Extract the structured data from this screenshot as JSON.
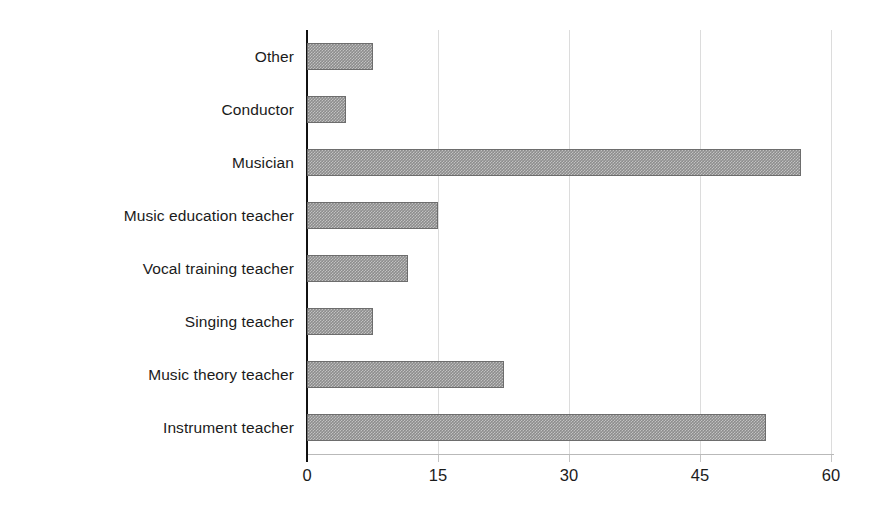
{
  "chart_data": {
    "type": "bar",
    "orientation": "horizontal",
    "title": "",
    "subtitle": "",
    "xlabel": "",
    "ylabel": "",
    "categories": [
      "Instrument teacher",
      "Music theory teacher",
      "Singing teacher",
      "Vocal training teacher",
      "Music education teacher",
      "Musician",
      "Conductor",
      "Other"
    ],
    "values": [
      52.5,
      22.5,
      7.5,
      11.5,
      15,
      56.5,
      4.5,
      7.5
    ],
    "xlim": [
      0,
      60
    ],
    "xticks": [
      0,
      15,
      30,
      45,
      60
    ],
    "xtick_labels": [
      "0",
      "15",
      "30",
      "45",
      "60"
    ],
    "grid": "vertical",
    "legend": "none",
    "bar_fill_color": "#8d8d8d",
    "bar_edge_color": "#6d6d6d",
    "axis_color": "#111111",
    "gridline_color": "#dcdcdc",
    "bars": [
      {
        "category": "Other",
        "value": 7.5,
        "row": 0
      },
      {
        "category": "Conductor",
        "value": 4.5,
        "row": 1
      },
      {
        "category": "Musician",
        "value": 56.5,
        "row": 2
      },
      {
        "category": "Music education teacher",
        "value": 15,
        "row": 3
      },
      {
        "category": "Vocal training teacher",
        "value": 11.5,
        "row": 4
      },
      {
        "category": "Singing teacher",
        "value": 7.5,
        "row": 5
      },
      {
        "category": "Music theory teacher",
        "value": 22.5,
        "row": 6
      },
      {
        "category": "Instrument teacher",
        "value": 52.5,
        "row": 7
      }
    ]
  }
}
